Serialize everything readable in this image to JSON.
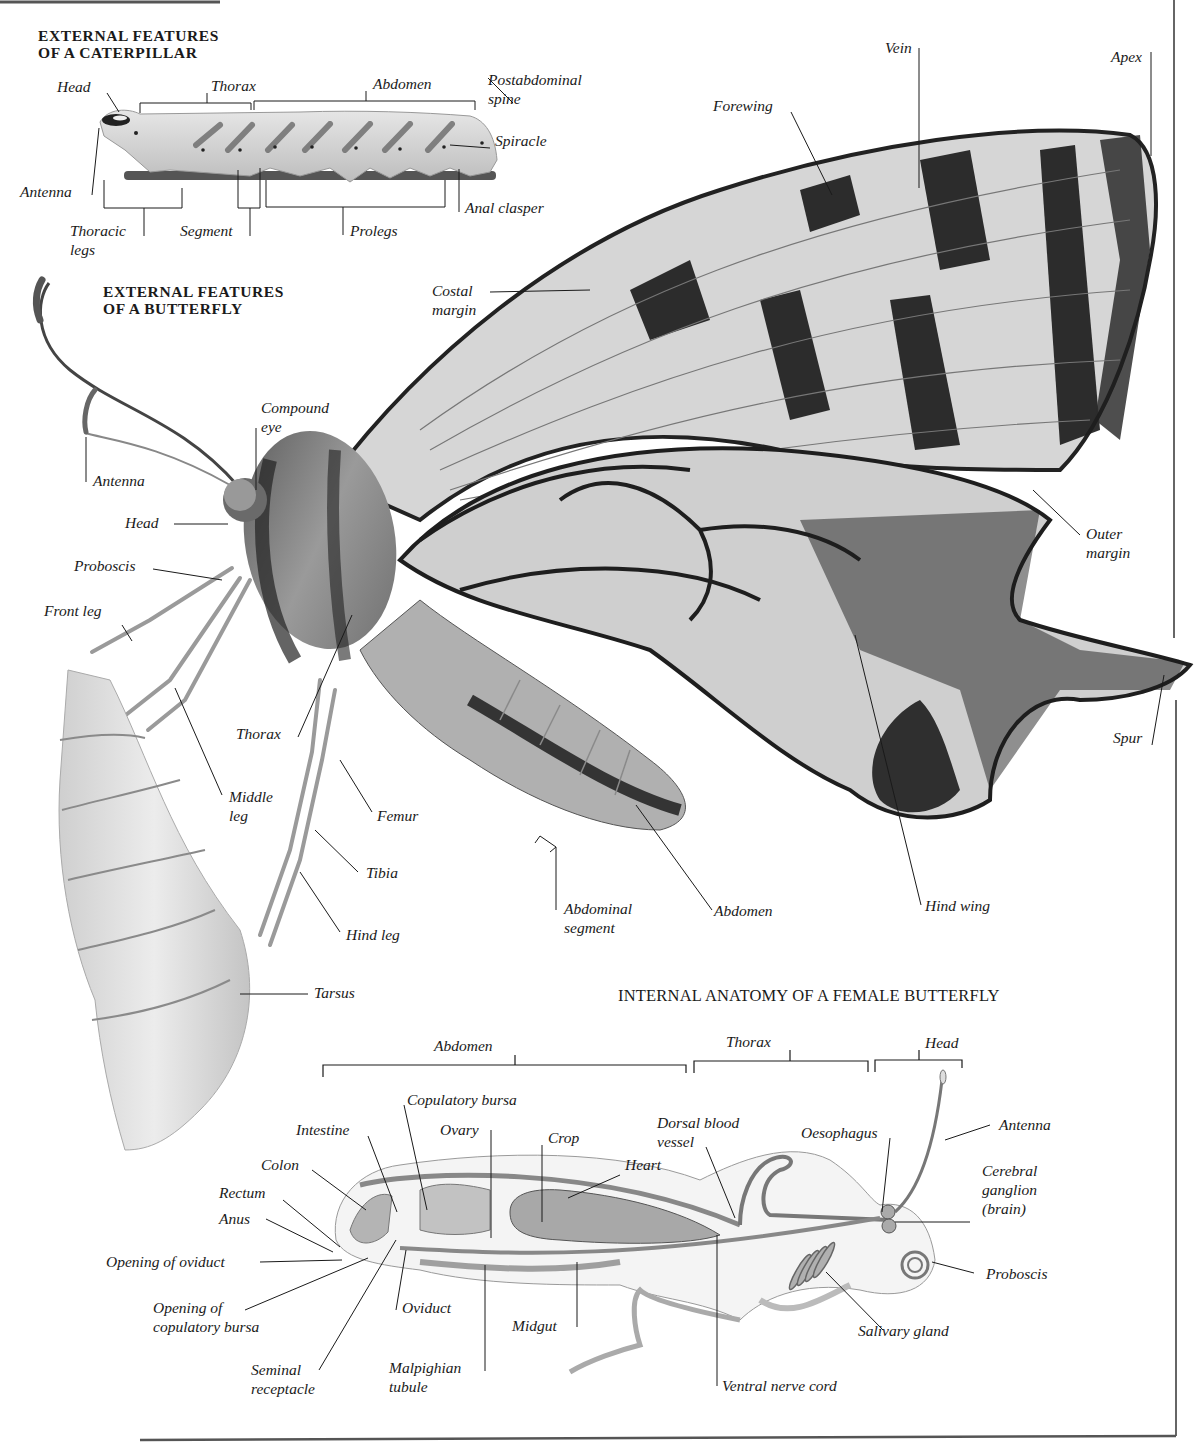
{
  "sections": {
    "caterpillar": {
      "heading_line1": "EXTERNAL FEATURES",
      "heading_line2": "OF A CATERPILLAR",
      "labels": {
        "head": "Head",
        "thorax": "Thorax",
        "abdomen": "Abdomen",
        "postabdominal_spine_1": "Postabdominal",
        "postabdominal_spine_2": "spine",
        "spiracle": "Spiracle",
        "antenna": "Antenna",
        "anal_clasper": "Anal clasper",
        "thoracic_legs_1": "Thoracic",
        "thoracic_legs_2": "legs",
        "segment": "Segment",
        "prolegs": "Prolegs"
      }
    },
    "butterfly": {
      "heading_line1": "EXTERNAL FEATURES",
      "heading_line2": "OF A BUTTERFLY",
      "labels": {
        "vein": "Vein",
        "apex": "Apex",
        "forewing": "Forewing",
        "costal_margin_1": "Costal",
        "costal_margin_2": "margin",
        "compound_eye_1": "Compound",
        "compound_eye_2": "eye",
        "antenna": "Antenna",
        "head": "Head",
        "proboscis": "Proboscis",
        "front_leg": "Front leg",
        "outer_margin_1": "Outer",
        "outer_margin_2": "margin",
        "spur": "Spur",
        "thorax": "Thorax",
        "middle_leg_1": "Middle",
        "middle_leg_2": "leg",
        "femur": "Femur",
        "tibia": "Tibia",
        "hind_leg": "Hind leg",
        "tarsus": "Tarsus",
        "abdominal_segment_1": "Abdominal",
        "abdominal_segment_2": "segment",
        "abdomen": "Abdomen",
        "hind_wing": "Hind wing"
      }
    },
    "internal": {
      "heading": "INTERNAL ANATOMY OF A FEMALE BUTTERFLY",
      "regions": {
        "abdomen": "Abdomen",
        "thorax": "Thorax",
        "head": "Head"
      },
      "labels": {
        "copulatory_bursa": "Copulatory bursa",
        "intestine": "Intestine",
        "ovary": "Ovary",
        "crop": "Crop",
        "dorsal_blood_vessel_1": "Dorsal blood",
        "dorsal_blood_vessel_2": "vessel",
        "oesophagus": "Oesophagus",
        "antenna": "Antenna",
        "colon": "Colon",
        "heart": "Heart",
        "rectum": "Rectum",
        "cerebral_ganglion_1": "Cerebral",
        "cerebral_ganglion_2": "ganglion",
        "cerebral_ganglion_3": "(brain)",
        "anus": "Anus",
        "opening_of_oviduct": "Opening of  oviduct",
        "proboscis": "Proboscis",
        "opening_of_copulatory_bursa_1": "Opening of",
        "opening_of_copulatory_bursa_2": "copulatory bursa",
        "oviduct": "Oviduct",
        "midgut": "Midgut",
        "salivary_gland": "Salivary gland",
        "seminal_receptacle_1": "Seminal",
        "seminal_receptacle_2": "receptacle",
        "malpighian_tubule_1": "Malpighian",
        "malpighian_tubule_2": "tubule",
        "ventral_nerve_cord": "Ventral nerve cord"
      }
    }
  },
  "colors": {
    "ink": "#1a1a1a",
    "wing_light": "#d9d9d9",
    "wing_dark": "#1e1e1e",
    "body_fur": "#8a8a8a",
    "organ_fill": "#b5b5b5",
    "pupa": "#e2e2e2"
  }
}
